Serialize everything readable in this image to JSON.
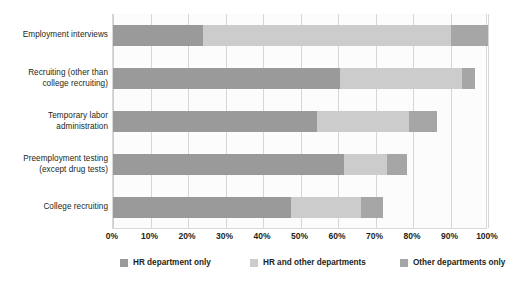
{
  "chart_data": {
    "type": "bar",
    "orientation": "horizontal",
    "stacked": true,
    "title": "",
    "xlabel": "",
    "ylabel": "",
    "xlim": [
      0,
      100
    ],
    "grid": true,
    "legend_position": "bottom",
    "categories": [
      "Employment interviews",
      "Recruiting (other than college recruiting)",
      "Temporary labor administration",
      "Preemployment testing (except drug tests)",
      "College recruiting"
    ],
    "category_lines": [
      [
        "Employment interviews"
      ],
      [
        "Recruiting (other than",
        "college recruiting)"
      ],
      [
        "Temporary labor",
        "administration"
      ],
      [
        "Preemployment testing",
        "(except drug tests)"
      ],
      [
        "College recruiting"
      ]
    ],
    "series": [
      {
        "name": "HR department only",
        "color": "#9a9a9a",
        "values": [
          24,
          60.5,
          54.5,
          61.5,
          47.5
        ]
      },
      {
        "name": "HR and other departments",
        "color": "#cccccc",
        "values": [
          66,
          32.5,
          24.5,
          11.5,
          18.5
        ]
      },
      {
        "name": "Other departments only",
        "color": "#a6a6a6",
        "values": [
          10,
          3.5,
          7.5,
          5.5,
          6
        ]
      }
    ],
    "x_ticks": [
      {
        "value": 0,
        "label": "0%"
      },
      {
        "value": 10,
        "label": "10%"
      },
      {
        "value": 20,
        "label": "20%"
      },
      {
        "value": 30,
        "label": "30%"
      },
      {
        "value": 40,
        "label": "40%"
      },
      {
        "value": 50,
        "label": "50%"
      },
      {
        "value": 60,
        "label": "60%"
      },
      {
        "value": 70,
        "label": "70%"
      },
      {
        "value": 80,
        "label": "80%"
      },
      {
        "value": 90,
        "label": "90%"
      },
      {
        "value": 100,
        "label": "100%"
      }
    ]
  },
  "legend": {
    "items": [
      {
        "label": "HR department only",
        "color": "#9a9a9a",
        "left": 8
      },
      {
        "label": "HR and other departments",
        "color": "#cccccc",
        "left": 138
      },
      {
        "label": "Other departments only",
        "color": "#a6a6a6",
        "left": 288
      }
    ]
  },
  "colors": {
    "background": "#ffffff",
    "plot_background": "#fcfcfc",
    "gridline": "#d6d6d6",
    "text": "#231f20"
  }
}
